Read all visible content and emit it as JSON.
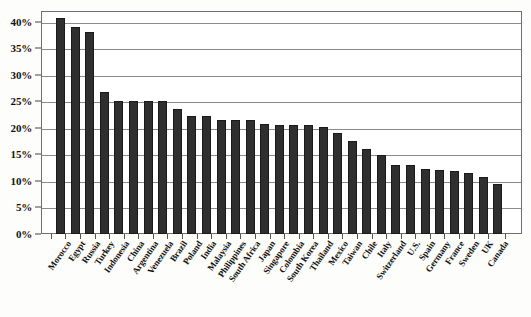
{
  "chart_data": {
    "type": "bar",
    "title": "",
    "subtitle": "",
    "xlabel": "",
    "ylabel": "",
    "ylim": [
      0,
      42
    ],
    "grid": true,
    "legend": "none",
    "orientation": "vertical",
    "bar_color": "#2f2f2f",
    "y_ticks": [
      "0%",
      "5%",
      "10%",
      "15%",
      "20%",
      "25%",
      "30%",
      "35%",
      "40%"
    ],
    "y_tick_values": [
      0,
      5,
      10,
      15,
      20,
      25,
      30,
      35,
      40
    ],
    "categories": [
      "Morocco",
      "Egypt",
      "Russia",
      "Turkey",
      "Indonesia",
      "China",
      "Argentina",
      "Venezuela",
      "Brazil",
      "Poland",
      "India",
      "Malaysia",
      "Philippines",
      "South Africa",
      "Japan",
      "Singapore",
      "Colombia",
      "South Korea",
      "Thailand",
      "Mexico",
      "Taiwan",
      "Chile",
      "Italy",
      "Switzerland",
      "U.S.",
      "Spain",
      "Germany",
      "France",
      "Sweden",
      "UK",
      "Canada"
    ],
    "values": [
      40.6,
      39.0,
      38.0,
      26.8,
      25.0,
      25.0,
      25.0,
      25.0,
      23.5,
      22.3,
      22.2,
      21.5,
      21.5,
      21.5,
      20.7,
      20.5,
      20.5,
      20.5,
      20.2,
      19.0,
      17.5,
      16.0,
      14.8,
      13.0,
      13.0,
      12.3,
      12.0,
      11.8,
      11.5,
      10.8,
      9.5
    ]
  },
  "axes": {
    "y_unit": "%",
    "x_tick_count": 31
  }
}
